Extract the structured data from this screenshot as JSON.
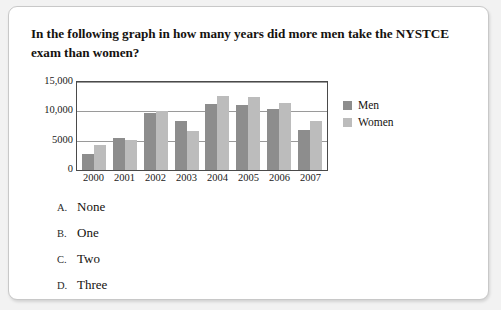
{
  "question": "In the following graph in how many years did more men take the NYSTCE exam than women?",
  "chart_data": {
    "type": "bar",
    "title": "",
    "xlabel": "",
    "ylabel": "",
    "ylim": [
      0,
      15000
    ],
    "yticks": [
      0,
      5000,
      10000,
      15000
    ],
    "ytick_labels": [
      "0",
      "5000",
      "10,000",
      "15,000"
    ],
    "grid": true,
    "legend_position": "right",
    "categories": [
      "2000",
      "2001",
      "2002",
      "2003",
      "2004",
      "2005",
      "2006",
      "2007"
    ],
    "series": [
      {
        "name": "Men",
        "color": "#8d8d8d",
        "values": [
          2800,
          5500,
          9700,
          8300,
          11200,
          11000,
          10400,
          6900
        ]
      },
      {
        "name": "Women",
        "color": "#bcbcbc",
        "values": [
          4200,
          5200,
          10100,
          6600,
          12600,
          12500,
          11400,
          8300
        ]
      }
    ]
  },
  "options": [
    {
      "letter": "A.",
      "text": "None"
    },
    {
      "letter": "B.",
      "text": "One"
    },
    {
      "letter": "C.",
      "text": "Two"
    },
    {
      "letter": "D.",
      "text": "Three"
    }
  ]
}
